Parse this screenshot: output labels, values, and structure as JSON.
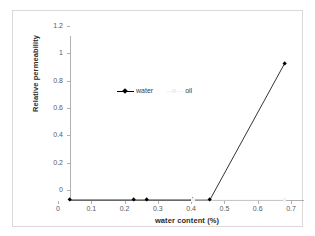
{
  "chart_data": {
    "type": "line",
    "title": "",
    "xlabel": "water content (%)",
    "ylabel": "Relative permeability",
    "xlim": [
      0,
      0.7
    ],
    "ylim": [
      0,
      1.2
    ],
    "grid": false,
    "legend_position": "upper-center-inside",
    "x_ticks": [
      "0",
      "0.1",
      "0.2",
      "0.3",
      "0.4",
      "0.5",
      "0.6",
      "0.7"
    ],
    "x_tick_values": [
      0,
      0.1,
      0.2,
      0.3,
      0.4,
      0.5,
      0.6,
      0.7
    ],
    "y_ticks": [
      "0",
      "0.2",
      "0.4",
      "0.6",
      "0.8",
      "1",
      "1.2"
    ],
    "y_tick_values": [
      0,
      0.2,
      0.4,
      0.6,
      0.8,
      1,
      1.2
    ],
    "series": [
      {
        "name": "water",
        "color": "#000000",
        "marker": "diamond",
        "line_style": "solid",
        "x": [
          0,
          0.19,
          0.23,
          0.37,
          0.42,
          0.645
        ],
        "y": [
          0,
          0,
          0,
          0,
          0,
          1
        ]
      },
      {
        "name": "oil",
        "color": "#f2f2f2",
        "marker": "square",
        "line_style": "solid",
        "x": [
          0.37,
          0.645
        ],
        "y": [
          0,
          0
        ]
      }
    ]
  },
  "legend": {
    "entries": [
      {
        "label": "water"
      },
      {
        "label": "oil"
      }
    ]
  },
  "axes": {
    "x_title": "water content (%)",
    "y_title": "Relative permeability"
  }
}
